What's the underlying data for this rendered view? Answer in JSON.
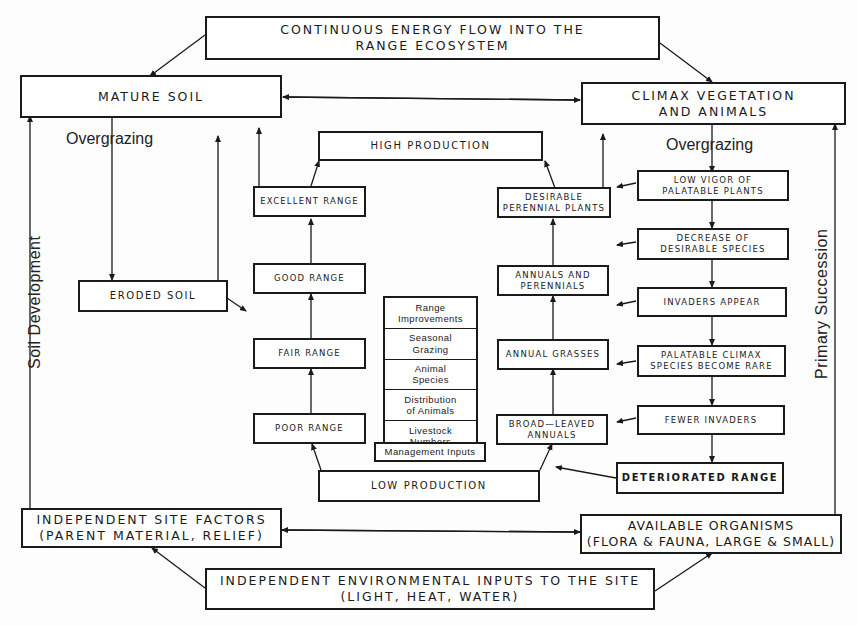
{
  "diagram": {
    "top_box": {
      "line1": "CONTINUOUS ENERGY FLOW INTO THE",
      "line2": "RANGE ECOSYSTEM"
    },
    "mature_soil": {
      "label": "MATURE SOIL"
    },
    "climax": {
      "line1": "CLIMAX VEGETATION",
      "line2": "AND ANIMALS"
    },
    "overgrazing_left": "Overgrazing",
    "overgrazing_right": "Overgrazing",
    "eroded_soil": {
      "label": "ERODED SOIL"
    },
    "high_production": {
      "label": "HIGH PRODUCTION"
    },
    "low_production": {
      "label": "LOW PRODUCTION"
    },
    "range_condition": [
      {
        "label": "EXCELLENT RANGE"
      },
      {
        "label": "GOOD RANGE"
      },
      {
        "label": "FAIR RANGE"
      },
      {
        "label": "POOR RANGE"
      }
    ],
    "vegetation_stages": [
      {
        "line1": "DESIRABLE",
        "line2": "PERENNIAL PLANTS"
      },
      {
        "line1": "ANNUALS AND",
        "line2": "PERENNIALS"
      },
      {
        "line1": "ANNUAL GRASSES",
        "line2": ""
      },
      {
        "line1": "BROAD—LEAVED",
        "line2": "ANNUALS"
      }
    ],
    "management": {
      "items": [
        {
          "line1": "Range",
          "line2": "Improvements"
        },
        {
          "line1": "Seasonal",
          "line2": "Grazing"
        },
        {
          "line1": "Animal",
          "line2": "Species"
        },
        {
          "line1": "Distribution",
          "line2": "of Animals"
        },
        {
          "line1": "Livestock",
          "line2": "Numbers"
        }
      ],
      "footer": "Management Inputs"
    },
    "degradation_steps": [
      {
        "line1": "LOW VIGOR OF",
        "line2": "PALATABLE PLANTS"
      },
      {
        "line1": "DECREASE OF",
        "line2": "DESIRABLE SPECIES"
      },
      {
        "line1": "INVADERS APPEAR",
        "line2": ""
      },
      {
        "line1": "PALATABLE CLIMAX",
        "line2": "SPECIES BECOME RARE"
      },
      {
        "line1": "FEWER INVADERS",
        "line2": ""
      }
    ],
    "deteriorated_range": {
      "label": "DETERIORATED RANGE"
    },
    "site_factors": {
      "line1": "INDEPENDENT SITE FACTORS",
      "line2": "(PARENT MATERIAL, RELIEF)"
    },
    "organisms": {
      "line1": "AVAILABLE ORGANISMS",
      "line2": "(FLORA & FAUNA, LARGE & SMALL)"
    },
    "env_inputs": {
      "line1": "INDEPENDENT ENVIRONMENTAL INPUTS TO THE SITE",
      "line2": "(LIGHT, HEAT, WATER)"
    },
    "side_left": "Soil Development",
    "side_right": "Primary Succession"
  }
}
